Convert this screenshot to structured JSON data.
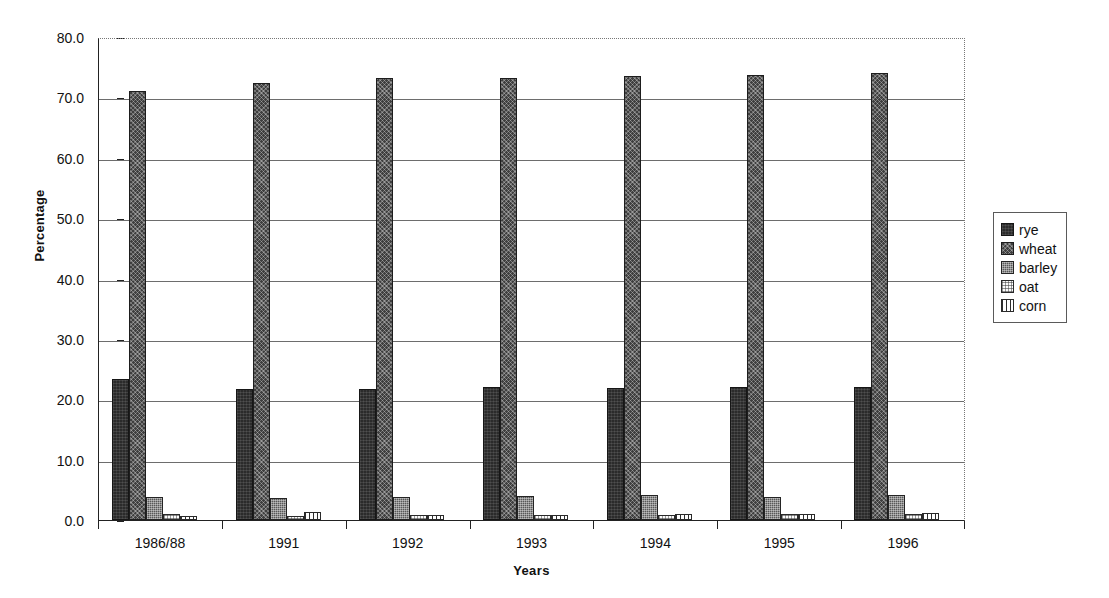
{
  "chart_data": {
    "type": "bar",
    "title": "",
    "xlabel": "Years",
    "ylabel": "Percentage",
    "categories": [
      "1986/88",
      "1991",
      "1992",
      "1993",
      "1994",
      "1995",
      "1996"
    ],
    "series": [
      {
        "name": "rye",
        "values": [
          23.3,
          21.7,
          21.7,
          22.0,
          21.8,
          22.0,
          22.0
        ]
      },
      {
        "name": "wheat",
        "values": [
          71.0,
          72.4,
          73.2,
          73.2,
          73.6,
          73.7,
          74.1
        ]
      },
      {
        "name": "barley",
        "values": [
          3.8,
          3.7,
          3.8,
          3.9,
          4.1,
          3.8,
          4.1
        ]
      },
      {
        "name": "oat",
        "values": [
          1.0,
          0.7,
          0.8,
          0.8,
          0.9,
          1.0,
          1.0
        ]
      },
      {
        "name": "corn",
        "values": [
          0.7,
          1.4,
          0.9,
          0.8,
          1.0,
          1.0,
          1.1
        ]
      }
    ],
    "ylim": [
      0.0,
      80.0
    ],
    "y_ticks": [
      "0.0",
      "10.0",
      "20.0",
      "30.0",
      "40.0",
      "50.0",
      "60.0",
      "70.0",
      "80.0"
    ],
    "y_tick_values": [
      0.0,
      10.0,
      20.0,
      30.0,
      40.0,
      50.0,
      60.0,
      70.0,
      80.0
    ],
    "grid": "horizontal",
    "legend_position": "right",
    "legend_entries": [
      "rye",
      "wheat",
      "barley",
      "oat",
      "corn"
    ]
  },
  "legend": {
    "items": [
      {
        "label": "rye",
        "swatch": "dark-dense-pattern"
      },
      {
        "label": "wheat",
        "swatch": "dark-crosshatch-pattern"
      },
      {
        "label": "barley",
        "swatch": "medium-dotted-pattern"
      },
      {
        "label": "oat",
        "swatch": "light-dotted-pattern"
      },
      {
        "label": "corn",
        "swatch": "vertical-stripe-pattern"
      }
    ]
  },
  "axes": {
    "y_title": "Percentage",
    "x_title": "Years"
  }
}
